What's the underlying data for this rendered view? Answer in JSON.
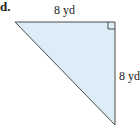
{
  "problem": {
    "label": "d."
  },
  "figure": {
    "type": "right-triangle",
    "fill_color": "#dcedf7",
    "stroke_color": "#4a4a4a",
    "vertices": {
      "top_left": [
        15,
        22
      ],
      "right_angle": [
        115,
        22
      ],
      "bottom": [
        115,
        125
      ]
    },
    "labels": {
      "top_side": "8 yd",
      "right_side": "8 yd"
    }
  }
}
